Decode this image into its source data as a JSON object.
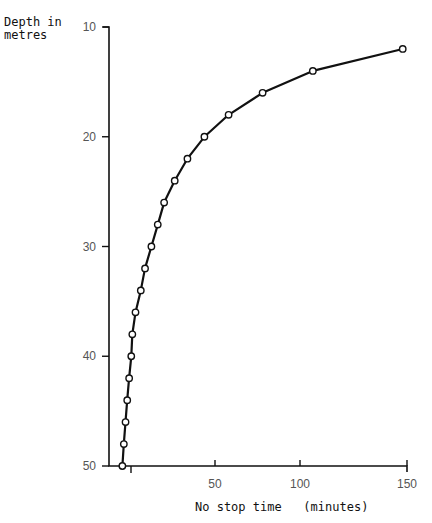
{
  "chart_data": {
    "type": "line",
    "title": "",
    "xlabel": "No stop time   (minutes)",
    "ylabel": "Depth in\nmetres",
    "x_ticks": [
      50,
      100,
      150
    ],
    "x_minor_ticks": [
      0
    ],
    "y_ticks": [
      10,
      20,
      30,
      40,
      50
    ],
    "xlim": [
      0,
      150
    ],
    "ylim": [
      50,
      10
    ],
    "y_inverted": true,
    "grid": false,
    "legend": null,
    "series": [
      {
        "name": "No stop time vs depth",
        "marker": "open-circle",
        "points": [
          {
            "depth": 12,
            "time": 148
          },
          {
            "depth": 14,
            "time": 106
          },
          {
            "depth": 16,
            "time": 78
          },
          {
            "depth": 18,
            "time": 58
          },
          {
            "depth": 20,
            "time": 45
          },
          {
            "depth": 22,
            "time": 37
          },
          {
            "depth": 24,
            "time": 31
          },
          {
            "depth": 26,
            "time": 26
          },
          {
            "depth": 28,
            "time": 23
          },
          {
            "depth": 30,
            "time": 20
          },
          {
            "depth": 32,
            "time": 17
          },
          {
            "depth": 34,
            "time": 15
          },
          {
            "depth": 36,
            "time": 12.5
          },
          {
            "depth": 38,
            "time": 11
          },
          {
            "depth": 40,
            "time": 10.5
          },
          {
            "depth": 42,
            "time": 9.5
          },
          {
            "depth": 44,
            "time": 8.6
          },
          {
            "depth": 46,
            "time": 7.8
          },
          {
            "depth": 48,
            "time": 7
          },
          {
            "depth": 50,
            "time": 6.3
          }
        ]
      }
    ]
  },
  "labels": {
    "ylabel": "Depth in\nmetres",
    "xlabel": "No stop time   (minutes)"
  },
  "colors": {
    "line": "#111111",
    "axis": "#111111",
    "tick_label": "#555555"
  }
}
